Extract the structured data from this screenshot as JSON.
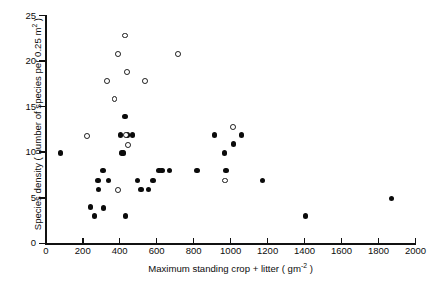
{
  "chart_data": {
    "type": "scatter",
    "title": "",
    "xlabel_text": "Maximum standing crop + litter  ( gm",
    "xlabel_sup": "-2",
    "xlabel_tail": " )",
    "ylabel_text": "Species density ( number of species per 0.25 m",
    "ylabel_sup": "2",
    "ylabel_tail": " )",
    "xlim": [
      0,
      2000
    ],
    "ylim": [
      0,
      25
    ],
    "xticks": [
      0,
      200,
      400,
      600,
      800,
      1000,
      1200,
      1400,
      1600,
      1800,
      2000
    ],
    "yticks": [
      0,
      5,
      10,
      15,
      20,
      25
    ],
    "grid": false,
    "legend": "none",
    "marker_colors": {
      "filled": "#0b0b0b",
      "open_edge": "#1a1a1a",
      "open_face": "#ffffff"
    },
    "series": [
      {
        "name": "filled-circles",
        "marker": "filled-circle",
        "points": [
          [
            80,
            9.9
          ],
          [
            243,
            4.0
          ],
          [
            265,
            3.0
          ],
          [
            282,
            6.9
          ],
          [
            285,
            5.9
          ],
          [
            310,
            8.0
          ],
          [
            313,
            3.9
          ],
          [
            338,
            6.9
          ],
          [
            405,
            11.9
          ],
          [
            413,
            9.9
          ],
          [
            420,
            9.9
          ],
          [
            428,
            13.9
          ],
          [
            432,
            3.0
          ],
          [
            443,
            11.9
          ],
          [
            470,
            11.9
          ],
          [
            497,
            6.9
          ],
          [
            515,
            5.9
          ],
          [
            555,
            5.9
          ],
          [
            580,
            6.9
          ],
          [
            612,
            8.0
          ],
          [
            628,
            8.0
          ],
          [
            668,
            8.0
          ],
          [
            818,
            8.0
          ],
          [
            912,
            11.9
          ],
          [
            968,
            9.9
          ],
          [
            975,
            8.0
          ],
          [
            1015,
            10.9
          ],
          [
            1058,
            11.9
          ],
          [
            1172,
            6.9
          ],
          [
            1405,
            3.0
          ],
          [
            1870,
            4.9
          ]
        ]
      },
      {
        "name": "open-circles",
        "marker": "open-circle",
        "points": [
          [
            223,
            11.8
          ],
          [
            330,
            17.8
          ],
          [
            372,
            15.8
          ],
          [
            390,
            20.8
          ],
          [
            392,
            5.9
          ],
          [
            430,
            22.8
          ],
          [
            432,
            11.9
          ],
          [
            441,
            18.8
          ],
          [
            443,
            10.8
          ],
          [
            538,
            17.8
          ],
          [
            715,
            20.8
          ],
          [
            968,
            6.9
          ],
          [
            1012,
            12.8
          ]
        ]
      }
    ]
  }
}
